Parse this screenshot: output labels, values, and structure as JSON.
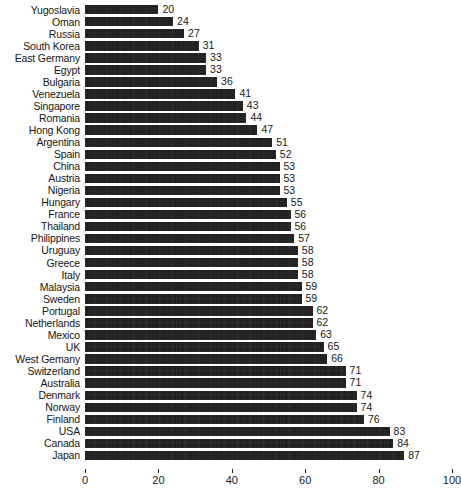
{
  "chart_data": {
    "type": "bar",
    "orientation": "horizontal",
    "title": "",
    "subtitle": "",
    "xlabel": "",
    "ylabel": "",
    "xlim": [
      0,
      100
    ],
    "xticks": [
      0,
      20,
      40,
      60,
      80,
      100
    ],
    "grid": false,
    "legend": null,
    "bar_color": "#1a1a1a",
    "background_color": "#ffffff",
    "data_labels": true,
    "categories": [
      "Yugoslavia",
      "Oman",
      "Russia",
      "South Korea",
      "East Germany",
      "Egypt",
      "Bulgaria",
      "Venezuela",
      "Singapore",
      "Romania",
      "Hong Kong",
      "Argentina",
      "Spain",
      "China",
      "Austria",
      "Nigeria",
      "Hungary",
      "France",
      "Thailand",
      "Philippines",
      "Uruguay",
      "Greece",
      "Italy",
      "Malaysia",
      "Sweden",
      "Portugal",
      "Netherlands",
      "Mexico",
      "UK",
      "West Gemany",
      "Switzerland",
      "Australia",
      "Denmark",
      "Norway",
      "Finland",
      "USA",
      "Canada",
      "Japan"
    ],
    "values": [
      20,
      24,
      27,
      31,
      33,
      33,
      36,
      41,
      43,
      44,
      47,
      51,
      52,
      53,
      53,
      53,
      55,
      56,
      56,
      57,
      58,
      58,
      58,
      59,
      59,
      62,
      62,
      63,
      65,
      66,
      71,
      71,
      74,
      74,
      76,
      83,
      84,
      87
    ]
  }
}
